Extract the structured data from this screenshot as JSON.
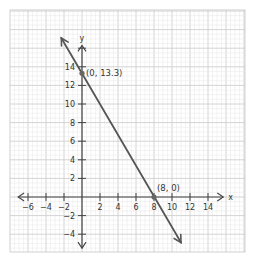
{
  "chart_data": {
    "type": "line",
    "title": "",
    "xlabel": "x",
    "ylabel": "y",
    "xlim": [
      -7,
      16
    ],
    "ylim": [
      -5.5,
      19
    ],
    "grid": true,
    "x_ticks": [
      -6,
      -4,
      -2,
      2,
      4,
      6,
      8,
      10,
      12,
      14
    ],
    "y_ticks": [
      -4,
      -2,
      2,
      4,
      6,
      8,
      10,
      12,
      14
    ],
    "x_tick_labels": [
      "−6",
      "−4",
      "−2",
      "2",
      "4",
      "6",
      "8",
      "10",
      "12",
      "14"
    ],
    "y_tick_labels": [
      "−4",
      "−2",
      "2",
      "4",
      "6",
      "8",
      "10",
      "12",
      "14"
    ],
    "series": [
      {
        "name": "line",
        "color": "#555555",
        "x": [
          -2.3,
          11
        ],
        "y": [
          17.1,
          -4.9
        ],
        "arrows": "both"
      }
    ],
    "points": [
      {
        "x": 0,
        "y": 13.3,
        "label": "(0, 13.3)"
      },
      {
        "x": 8,
        "y": 0,
        "label": "(8, 0)"
      }
    ],
    "colors": {
      "grid_minor": "#e6e6e6",
      "grid_major": "#cfcfcf",
      "axis": "#444444",
      "line": "#555555",
      "point": "#666666"
    }
  }
}
